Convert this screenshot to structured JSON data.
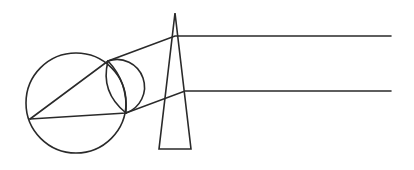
{
  "diagram": {
    "title": "",
    "colors": {
      "stroke": "#2a2a2a",
      "background": "#ffffff"
    },
    "elements": {
      "eyeball": {
        "cx": 76,
        "cy": 103,
        "r": 50
      },
      "cornea": {
        "cx": 117,
        "cy": 87,
        "r": 23
      },
      "lens": {
        "top": [
          108,
          61
        ],
        "bottom": [
          126,
          113
        ]
      },
      "nodal_point": [
        30,
        119
      ],
      "prism": {
        "apex": [
          175,
          13
        ],
        "base_left": [
          159,
          149
        ],
        "base_right": [
          191,
          149
        ]
      },
      "rays": [
        {
          "name": "upper-ray",
          "points": [
            [
              391,
              36
            ],
            [
              175,
              36
            ],
            [
              108,
              61
            ],
            [
              30,
              119
            ]
          ]
        },
        {
          "name": "lower-ray",
          "points": [
            [
              391,
              91
            ],
            [
              185,
              91
            ],
            [
              126,
              113
            ],
            [
              30,
              119
            ]
          ]
        }
      ]
    },
    "labels": []
  }
}
